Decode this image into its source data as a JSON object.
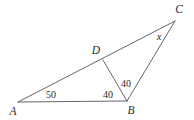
{
  "figure": {
    "type": "geometry-diagram",
    "background_color": "#ffffff",
    "stroke_color": "#54545a"
  },
  "points": {
    "A": {
      "label": "A",
      "x": 18,
      "y": 102,
      "label_x": 13,
      "label_y": 112
    },
    "B": {
      "label": "B",
      "x": 127,
      "y": 101,
      "label_x": 131,
      "label_y": 111
    },
    "C": {
      "label": "C",
      "x": 175,
      "y": 21,
      "label_x": 179,
      "label_y": 10
    },
    "D": {
      "label": "D",
      "x": 103,
      "y": 60,
      "label_x": 96,
      "label_y": 51
    }
  },
  "segments": [
    {
      "name": "segment-AB",
      "from": "A",
      "to": "B"
    },
    {
      "name": "segment-AC",
      "from": "A",
      "to": "C"
    },
    {
      "name": "segment-BC",
      "from": "B",
      "to": "C"
    },
    {
      "name": "segment-DB",
      "from": "D",
      "to": "B"
    }
  ],
  "angle_labels": [
    {
      "name": "angle-A",
      "value": "50",
      "x": 51,
      "y": 95
    },
    {
      "name": "angle-ABD",
      "value": "40",
      "x": 108,
      "y": 95
    },
    {
      "name": "angle-DBC",
      "value": "40",
      "x": 126,
      "y": 84
    }
  ],
  "unknown_labels": [
    {
      "name": "angle-C-unknown",
      "value": "x",
      "x": 159,
      "y": 37
    }
  ]
}
